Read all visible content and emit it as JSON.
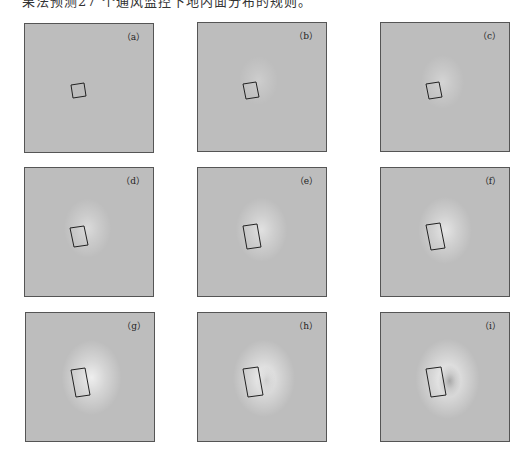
{
  "caption_fragment": "果法预测27 个通风监控下地内面分布的规则。",
  "figure": {
    "panels": [
      {
        "id": "a",
        "label": "（a）",
        "x": 24,
        "y": 23,
        "glow": 0.0,
        "dark": 0.0,
        "rect": [
          [
            46,
            61
          ],
          [
            59,
            59
          ],
          [
            61,
            72
          ],
          [
            48,
            74
          ]
        ]
      },
      {
        "id": "b",
        "label": "（b）",
        "x": 197,
        "y": 22,
        "glow": 0.25,
        "dark": 0.0,
        "rect": [
          [
            45,
            61
          ],
          [
            58,
            59
          ],
          [
            61,
            74
          ],
          [
            48,
            76
          ]
        ]
      },
      {
        "id": "c",
        "label": "（c）",
        "x": 380,
        "y": 22,
        "glow": 0.35,
        "dark": 0.0,
        "rect": [
          [
            45,
            61
          ],
          [
            58,
            59
          ],
          [
            61,
            74
          ],
          [
            48,
            76
          ]
        ]
      },
      {
        "id": "d",
        "label": "（d）",
        "x": 24,
        "y": 167,
        "glow": 0.45,
        "dark": 0.0,
        "rect": [
          [
            45,
            60
          ],
          [
            59,
            58
          ],
          [
            63,
            77
          ],
          [
            49,
            79
          ]
        ]
      },
      {
        "id": "e",
        "label": "（e）",
        "x": 197,
        "y": 167,
        "glow": 0.55,
        "dark": 0.0,
        "rect": [
          [
            45,
            58
          ],
          [
            59,
            56
          ],
          [
            63,
            79
          ],
          [
            49,
            81
          ]
        ]
      },
      {
        "id": "f",
        "label": "（f）",
        "x": 380,
        "y": 167,
        "glow": 0.6,
        "dark": 0.0,
        "rect": [
          [
            45,
            57
          ],
          [
            59,
            55
          ],
          [
            64,
            80
          ],
          [
            50,
            82
          ]
        ]
      },
      {
        "id": "g",
        "label": "（g）",
        "x": 25,
        "y": 312,
        "glow": 0.75,
        "dark": 0.0,
        "rect": [
          [
            45,
            57
          ],
          [
            59,
            55
          ],
          [
            64,
            82
          ],
          [
            50,
            84
          ]
        ]
      },
      {
        "id": "h",
        "label": "（h）",
        "x": 197,
        "y": 312,
        "glow": 0.8,
        "dark": 0.15,
        "rect": [
          [
            45,
            56
          ],
          [
            60,
            54
          ],
          [
            65,
            82
          ],
          [
            50,
            84
          ]
        ]
      },
      {
        "id": "i",
        "label": "（i）",
        "x": 380,
        "y": 312,
        "glow": 0.85,
        "dark": 0.35,
        "rect": [
          [
            45,
            56
          ],
          [
            60,
            54
          ],
          [
            65,
            82
          ],
          [
            50,
            84
          ]
        ]
      }
    ],
    "colors": {
      "background": "#bdbdbd",
      "glow": "#ffffff",
      "border": "#555555",
      "rect": "#222222"
    }
  }
}
